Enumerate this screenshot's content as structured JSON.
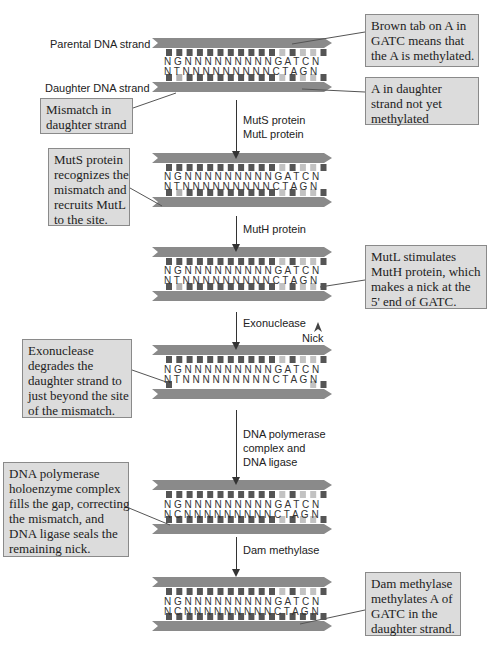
{
  "labels": {
    "parental": "Parental DNA strand",
    "daughter": "Daughter DNA strand",
    "nick": "Nick"
  },
  "callouts": {
    "brown_tab": [
      "Brown tab on A in",
      "GATC means that",
      "the A is methylated."
    ],
    "not_methylated": [
      "A in daughter",
      "strand not yet",
      "methylated"
    ],
    "mismatch": [
      "Mismatch in",
      "daughter strand"
    ],
    "muts": [
      "MutS protein",
      "recognizes the",
      "mismatch and",
      "recruits MutL",
      "to the site."
    ],
    "mutl": [
      "MutL stimulates",
      "MutH protein, which",
      "makes a nick at the",
      "5' end of GATC."
    ],
    "exonuclease": [
      "Exonuclease",
      "degrades the",
      "daughter strand to",
      "just beyond the site",
      "of the mismatch."
    ],
    "polymerase": [
      "DNA polymerase",
      "holoenzyme complex",
      "fills the gap, correcting",
      "the mismatch, and",
      "DNA ligase seals the",
      "remaining nick."
    ],
    "dam": [
      "Dam methylase",
      "methylates A of",
      "GATC in the",
      "daughter strand."
    ]
  },
  "steps": [
    {
      "lines": [
        "MutS protein",
        "MutL protein"
      ]
    },
    {
      "lines": [
        "MutH protein"
      ]
    },
    {
      "lines": [
        "Exonuclease"
      ]
    },
    {
      "lines": [
        "DNA polymerase",
        "complex and",
        "DNA ligase"
      ]
    },
    {
      "lines": [
        "Dam methylase"
      ]
    }
  ],
  "sequences": {
    "top": "N G N N N N N N N N N G A T C N",
    "bottom_mismatch": "N T N N N N N N N N N C T A G N",
    "bottom_fixed": "N C N N N N N N N N N C T A G N"
  },
  "colors": {
    "strand": "#8a8a8a",
    "base_dark": "#555555",
    "base_light": "#c2c2c2",
    "base_mismatch": "#b0b0b0",
    "callout_bg": "#dcdcdc"
  }
}
